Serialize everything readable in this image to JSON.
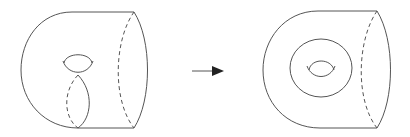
{
  "diagram": {
    "figures": [
      {
        "name": "surface-before",
        "features": [
          "outer-boundary",
          "handle-hole",
          "dashed-meridian-arc",
          "dashed-cut-arc"
        ]
      },
      {
        "name": "surface-after",
        "features": [
          "outer-boundary",
          "inner-circle",
          "hole",
          "dashed-cut-arc"
        ]
      }
    ],
    "arrow": {
      "direction": "right",
      "meaning": "transforms-to"
    },
    "colors": {
      "line": "#555555",
      "arrow": "#222222",
      "background": "#ffffff"
    }
  }
}
